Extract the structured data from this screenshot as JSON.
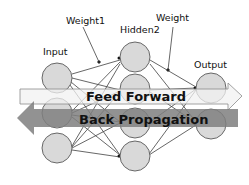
{
  "diagram": {
    "type": "neural-network",
    "labels": {
      "input": "Input",
      "hidden": "Hidden2",
      "output": "Output",
      "weight1": "Weight1",
      "weight2": "Weight"
    },
    "layers": [
      {
        "name": "Input",
        "node_count": 3
      },
      {
        "name": "Hidden2",
        "node_count": 4
      },
      {
        "name": "Output",
        "node_count": 2
      }
    ],
    "arrows": {
      "feed_forward": "Feed Forward",
      "back_propagation": "Back Propagation"
    },
    "colors": {
      "node_fill": "#d9d9d9",
      "node_stroke": "#595959",
      "edge": "#404040",
      "feed_forward_fill": "#f2f2f2",
      "back_propagation_fill": "#8c8c8c"
    }
  }
}
